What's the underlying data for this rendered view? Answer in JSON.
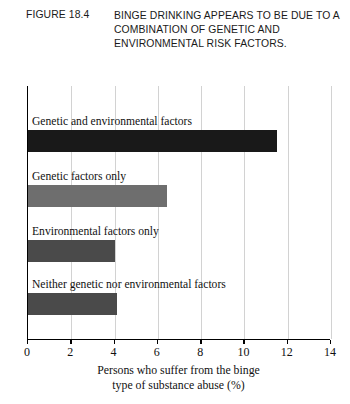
{
  "figure": {
    "number": "FIGURE 18.4",
    "title": "BINGE DRINKING APPEARS TO BE DUE TO A COMBINATION OF GENETIC AND ENVIRONMENTAL RISK FACTORS."
  },
  "axis_caption_line1": "Persons who suffer from the binge",
  "axis_caption_line2": "type of substance abuse (%)",
  "chart_data": {
    "type": "bar",
    "orientation": "horizontal",
    "title": "BINGE DRINKING APPEARS TO BE DUE TO A COMBINATION OF GENETIC AND ENVIRONMENTAL RISK FACTORS.",
    "xlabel": "Persons who suffer from the binge type of substance abuse (%)",
    "ylabel": "",
    "xlim": [
      0,
      14
    ],
    "xticks": [
      0,
      2,
      4,
      6,
      8,
      10,
      12,
      14
    ],
    "xtick_labels": [
      "0",
      "2",
      "4",
      "6",
      "8",
      "10",
      "12",
      "14"
    ],
    "grid": "vertical",
    "legend": "none",
    "categories": [
      "Genetic and environmental factors",
      "Genetic factors only",
      "Environmental factors only",
      "Neither genetic nor environmental factors"
    ],
    "values": [
      11.5,
      6.4,
      4.0,
      4.1
    ],
    "bar_colors": [
      "#191919",
      "#6e6e6e",
      "#4a4a4a",
      "#4a4a4a"
    ]
  }
}
